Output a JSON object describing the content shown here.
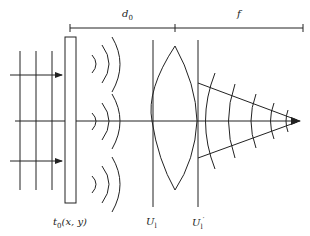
{
  "diagram": {
    "title": "",
    "type": "optics-schematic",
    "colors": {
      "stroke": "#222222",
      "background": "#ffffff"
    },
    "dimensions": [
      {
        "id": "d0",
        "label": "d",
        "sub": "0"
      },
      {
        "id": "f",
        "label": "f"
      }
    ],
    "labels": {
      "transparency": {
        "main": "t",
        "sub": "0",
        "args": "(x, y)"
      },
      "lens_front_plane": {
        "main": "U",
        "sub": "l"
      },
      "lens_back_plane": {
        "main": "U",
        "sub": "l",
        "sup": "′"
      }
    },
    "elements": [
      {
        "name": "incident-plane-wave",
        "count_wavefronts": 3,
        "count_arrows": 2
      },
      {
        "name": "object-transparency",
        "shape": "rectangle"
      },
      {
        "name": "diffracted-wavelets",
        "groups": 3,
        "arcs_per_group": 3
      },
      {
        "name": "thin-lens",
        "shape": "biconvex"
      },
      {
        "name": "converging-wavefronts",
        "arcs": 5
      },
      {
        "name": "focal-point-arrow"
      },
      {
        "name": "optical-axis"
      }
    ]
  }
}
